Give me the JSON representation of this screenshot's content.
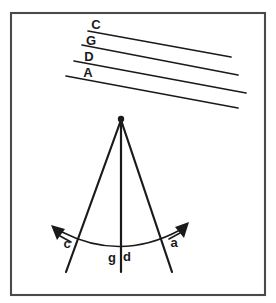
{
  "figure": {
    "name": "ray-diagram-with-parallel-wavefronts",
    "background_color": "#ffffff",
    "ink_color": "#1a1a1a",
    "frame_color": "#4a4a4a",
    "frame": {
      "x": 11,
      "y": 13,
      "width": 254,
      "height": 282
    },
    "parallel_lines": {
      "group_name": "labelled-parallel-lines",
      "count": 4,
      "slope_note": "descending left-to-right",
      "items": [
        {
          "label": "C",
          "x1": 88,
          "y1": 31,
          "x2": 231,
          "y2": 57,
          "label_x": 96,
          "label_y": 29
        },
        {
          "label": "G",
          "x1": 82,
          "y1": 45,
          "x2": 238,
          "y2": 75,
          "label_x": 91,
          "label_y": 45
        },
        {
          "label": "D",
          "x1": 74,
          "y1": 61,
          "x2": 246,
          "y2": 93,
          "label_x": 89,
          "label_y": 61
        },
        {
          "label": "A",
          "x1": 66,
          "y1": 76,
          "x2": 238,
          "y2": 108,
          "label_x": 88,
          "label_y": 77
        }
      ]
    },
    "apex": {
      "name": "apex-point",
      "x": 121,
      "y": 119,
      "radius": 3.2
    },
    "rays": [
      {
        "name": "left-ray",
        "x1": 121,
        "y1": 120,
        "x2": 66,
        "y2": 272
      },
      {
        "name": "center-ray",
        "x1": 121,
        "y1": 120,
        "x2": 121,
        "y2": 272
      },
      {
        "name": "right-ray",
        "x1": 121,
        "y1": 120,
        "x2": 172,
        "y2": 272
      }
    ],
    "arc": {
      "name": "angle-arc",
      "start_x": 62,
      "start_y": 232,
      "end_x": 180,
      "end_y": 230,
      "control_x": 121,
      "control_y": 262
    },
    "arrows": [
      {
        "name": "left-arrowhead",
        "tip_x": 51,
        "tip_y": 225,
        "direction": "up-left"
      },
      {
        "name": "right-arrowhead",
        "tip_x": 189,
        "tip_y": 222,
        "direction": "up-right"
      }
    ],
    "lower_labels": [
      {
        "key": "c",
        "label": "c",
        "x": 67,
        "y": 248
      },
      {
        "key": "g",
        "label": "g",
        "x": 112,
        "y": 262
      },
      {
        "key": "d",
        "label": "d",
        "x": 127,
        "y": 261
      },
      {
        "key": "a",
        "label": "a",
        "x": 174,
        "y": 247
      }
    ]
  }
}
